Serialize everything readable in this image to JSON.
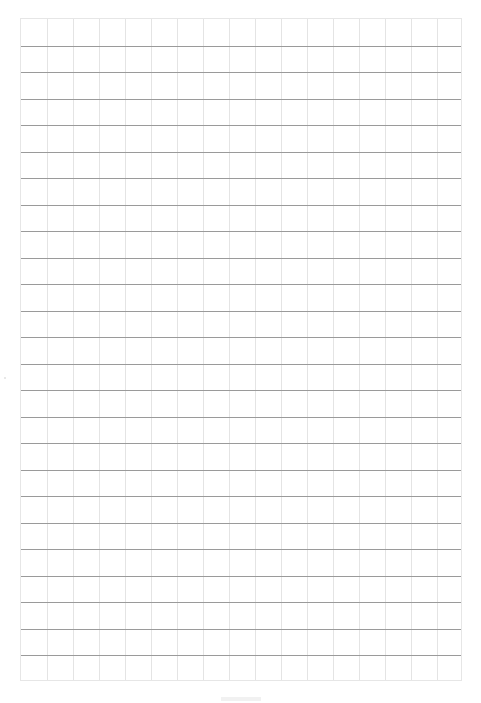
{
  "page": {
    "type": "graph-paper",
    "background_color": "#ffffff"
  },
  "grid": {
    "columns": 17,
    "rows": 25,
    "left": 20,
    "top": 18,
    "width": 442,
    "height": 663,
    "vertical_line_color": "#e4e4e4",
    "horizontal_line_color": "#9a9a9a",
    "border_color": "#e6e6e6"
  },
  "footer": {
    "text": ""
  }
}
